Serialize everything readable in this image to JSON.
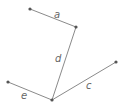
{
  "diagram": {
    "type": "graph",
    "points": {
      "a_start": {
        "x": 30,
        "y": 9
      },
      "a_end": {
        "x": 76,
        "y": 27
      },
      "junction": {
        "x": 52,
        "y": 100
      },
      "c_end": {
        "x": 116,
        "y": 62
      },
      "e_end": {
        "x": 8,
        "y": 82
      }
    },
    "segments": [
      {
        "label": "a",
        "from": "a_start",
        "to": "a_end",
        "label_pos": {
          "x": 57,
          "y": 17
        }
      },
      {
        "label": "d",
        "from": "a_end",
        "to": "junction",
        "label_pos": {
          "x": 56,
          "y": 62
        }
      },
      {
        "label": "c",
        "from": "junction",
        "to": "c_end",
        "label_pos": {
          "x": 87,
          "y": 89
        }
      },
      {
        "label": "e",
        "from": "e_end",
        "to": "junction",
        "label_pos": {
          "x": 23,
          "y": 98
        }
      }
    ],
    "colors": {
      "line": "#8a8a8a",
      "point": "#555555",
      "label": "#666666"
    }
  }
}
